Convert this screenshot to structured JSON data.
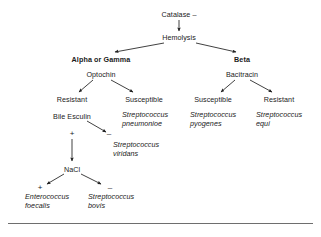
{
  "diagram": {
    "type": "dichotomous-key-flowchart",
    "nodes": {
      "catalase": {
        "label": "Catalase –",
        "x": 179,
        "y": 10,
        "style": "center"
      },
      "hemolysis": {
        "label": "Hemolysis",
        "x": 179,
        "y": 33,
        "style": "center"
      },
      "alpha_gamma": {
        "label": "Alpha or Gamma",
        "x": 101,
        "y": 55,
        "style": "center bold"
      },
      "beta": {
        "label": "Beta",
        "x": 242,
        "y": 55,
        "style": "center bold"
      },
      "optochin": {
        "label": "Optochin",
        "x": 101,
        "y": 70,
        "style": "center"
      },
      "bacitracin": {
        "label": "Bacitracin",
        "x": 242,
        "y": 70,
        "style": "center"
      },
      "optochin_resistant": {
        "label": "Resistant",
        "x": 72,
        "y": 95,
        "style": "center"
      },
      "optochin_susceptible": {
        "label": "Susceptible",
        "x": 144,
        "y": 95,
        "style": "center"
      },
      "bacitracin_susceptible": {
        "label": "Susceptible",
        "x": 213,
        "y": 95,
        "style": "center"
      },
      "bacitracin_resistant": {
        "label": "Resistant",
        "x": 279,
        "y": 95,
        "style": "center"
      },
      "s_pneumoniae": {
        "label": "Streptococcus\npneumonioe",
        "x": 122,
        "y": 110,
        "style": "left italic"
      },
      "s_pyogenes": {
        "label": "Streptococcus\npyogenes",
        "x": 190,
        "y": 110,
        "style": "left italic"
      },
      "s_equi": {
        "label": "Streptococcus\nequi",
        "x": 256,
        "y": 110,
        "style": "left italic"
      },
      "bile_esculin": {
        "label": "Bile Esculin",
        "x": 72,
        "y": 112,
        "style": "center"
      },
      "bile_plus": {
        "label": "+",
        "x": 72,
        "y": 130,
        "style": "center sign"
      },
      "bile_minus": {
        "label": "–",
        "x": 109,
        "y": 130,
        "style": "center sign"
      },
      "s_viridans": {
        "label": "Streptococcus\nviridans",
        "x": 113,
        "y": 140,
        "style": "left italic"
      },
      "nacl": {
        "label": "NaCl",
        "x": 72,
        "y": 165,
        "style": "center"
      },
      "nacl_plus": {
        "label": "+",
        "x": 40,
        "y": 184,
        "style": "center sign"
      },
      "nacl_minus": {
        "label": "–",
        "x": 110,
        "y": 184,
        "style": "center sign"
      },
      "e_faecalis": {
        "label": "Enterococcus\nfoecalis",
        "x": 25,
        "y": 192,
        "style": "left italic"
      },
      "s_bovis": {
        "label": "Streptococcus\nbovis",
        "x": 88,
        "y": 192,
        "style": "left italic"
      }
    },
    "edges": [
      {
        "from": "catalase",
        "to": "hemolysis",
        "kind": "arrow-down"
      },
      {
        "from": "hemolysis",
        "to": "alpha_gamma",
        "kind": "arrow-diagonal-left"
      },
      {
        "from": "hemolysis",
        "to": "beta",
        "kind": "arrow-diagonal-right"
      },
      {
        "from": "optochin",
        "to": "optochin_resistant",
        "kind": "arrow-diagonal-left"
      },
      {
        "from": "optochin",
        "to": "optochin_susceptible",
        "kind": "arrow-diagonal-right"
      },
      {
        "from": "bacitracin",
        "to": "bacitracin_susceptible",
        "kind": "arrow-diagonal-left"
      },
      {
        "from": "bacitracin",
        "to": "bacitracin_resistant",
        "kind": "arrow-diagonal-right"
      },
      {
        "from": "bile_esculin",
        "to": "s_viridans",
        "kind": "arrow-diagonal-right"
      },
      {
        "from": "bile_plus",
        "to": "nacl",
        "kind": "arrow-down"
      },
      {
        "from": "nacl",
        "to": "e_faecalis",
        "kind": "arrow-diagonal-left"
      },
      {
        "from": "nacl",
        "to": "s_bovis",
        "kind": "arrow-diagonal-right"
      }
    ],
    "colors": {
      "background": "#ffffff",
      "text": "#1a1a1a",
      "edge": "#1f1f1f",
      "rule": "#6e6e6e"
    }
  }
}
